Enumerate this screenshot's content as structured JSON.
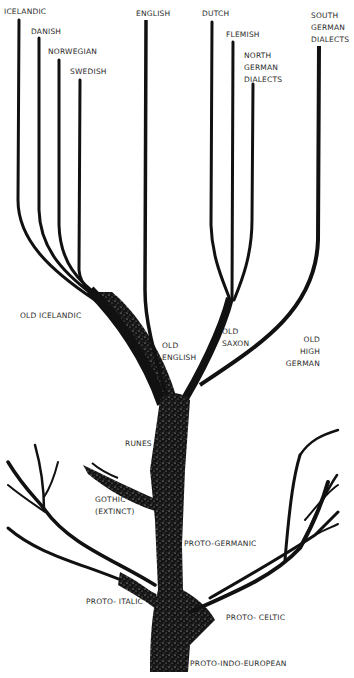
{
  "diagram": {
    "type": "language-family-tree",
    "root": "PROTO-INDO-EUROPEAN",
    "labels": {
      "icelandic": "ICELANDIC",
      "danish": "DANISH",
      "norwegian": "NORWEGIAN",
      "swedish": "SWEDISH",
      "english": "ENGLISH",
      "dutch": "DUTCH",
      "flemish": "FLEMISH",
      "north_german": [
        "NORTH",
        "GERMAN",
        "DIALECTS"
      ],
      "south_german": [
        "SOUTH",
        "GERMAN",
        "DIALECTS"
      ],
      "old_icelandic": "OLD ICELANDIC",
      "old_english": [
        "OLD",
        "ENGLISH"
      ],
      "old_saxon": [
        "OLD",
        "SAXON"
      ],
      "old_high_german": [
        "OLD",
        "HIGH",
        "GERMAN"
      ],
      "runes": "RUNES",
      "gothic": [
        "GOTHIC",
        "(EXTINCT)"
      ],
      "proto_germanic": "PROTO-GERMANIC",
      "proto_italic": "PROTO- ITALIC",
      "proto_celtic": "PROTO- CELTIC",
      "proto_indo_european": "PROTO-INDO-EUROPEAN"
    },
    "colors": {
      "ink": "#111111",
      "background": "#ffffff",
      "label": "#2a2a2a"
    }
  }
}
